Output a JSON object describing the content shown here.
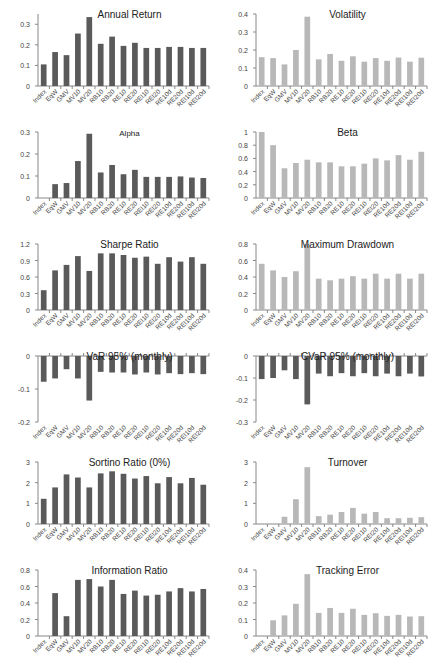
{
  "figure": {
    "categories": [
      "Index",
      "EqW",
      "GMV",
      "MV10",
      "MV20",
      "RB10",
      "RB20",
      "RE10",
      "RE20",
      "REI10",
      "REI20",
      "RE10d",
      "RE20d",
      "REI10d",
      "REI20d"
    ],
    "colors": {
      "dark_bar": "#5a5a5a",
      "light_bar": "#b8b8b8",
      "axis": "#888888"
    }
  },
  "chart_data": [
    {
      "type": "bar",
      "title": "Annual Return",
      "style": "dark",
      "categories": [
        "Index",
        "EqW",
        "GMV",
        "MV10",
        "MV20",
        "RB10",
        "RB20",
        "RE10",
        "RE20",
        "REI10",
        "REI20",
        "RE10d",
        "RE20d",
        "REI10d",
        "REI20d"
      ],
      "values": [
        0.105,
        0.165,
        0.15,
        0.255,
        0.335,
        0.205,
        0.24,
        0.195,
        0.21,
        0.185,
        0.185,
        0.19,
        0.19,
        0.185,
        0.185
      ],
      "ylim": [
        0,
        0.35
      ],
      "yticks": [
        0,
        0.1,
        0.2,
        0.3
      ],
      "ytick_labels": [
        "0",
        "0.1",
        "0.2",
        "0.3"
      ],
      "xlabel": "",
      "ylabel": ""
    },
    {
      "type": "bar",
      "title": "Volatility",
      "style": "light",
      "categories": [
        "Index",
        "EqW",
        "GMV",
        "MV10",
        "MV20",
        "RB10",
        "RB20",
        "RE10",
        "RE20",
        "REI10",
        "REI20",
        "RE10d",
        "RE20d",
        "REI10d",
        "REI20d"
      ],
      "values": [
        0.16,
        0.155,
        0.12,
        0.2,
        0.385,
        0.148,
        0.178,
        0.14,
        0.165,
        0.135,
        0.155,
        0.14,
        0.158,
        0.135,
        0.157
      ],
      "ylim": [
        0,
        0.4
      ],
      "yticks": [
        0,
        0.1,
        0.2,
        0.3,
        0.4
      ],
      "ytick_labels": [
        "0",
        "0.1",
        "0.2",
        "0.3",
        "0.4"
      ],
      "xlabel": "",
      "ylabel": ""
    },
    {
      "type": "bar",
      "title": "Alpha",
      "style": "dark",
      "categories": [
        "Index",
        "EqW",
        "GMV",
        "MV10",
        "MV20",
        "RB10",
        "RB20",
        "RE10",
        "RE20",
        "REI10",
        "REI20",
        "RE10d",
        "RE20d",
        "REI10d",
        "REI20d"
      ],
      "values": [
        0,
        0.063,
        0.068,
        0.168,
        0.292,
        0.116,
        0.15,
        0.108,
        0.128,
        0.096,
        0.096,
        0.096,
        0.098,
        0.093,
        0.091
      ],
      "ylim": [
        0,
        0.3
      ],
      "yticks": [
        0,
        0.1,
        0.2,
        0.3
      ],
      "ytick_labels": [
        "0",
        "0.1",
        "0.2",
        "0.3"
      ],
      "xlabel": "",
      "ylabel": ""
    },
    {
      "type": "bar",
      "title": "Beta",
      "style": "light",
      "categories": [
        "Index",
        "EqW",
        "GMV",
        "MV10",
        "MV20",
        "RB10",
        "RB20",
        "RE10",
        "RE20",
        "REI10",
        "REI20",
        "RE10d",
        "RE20d",
        "REI10d",
        "REI20d"
      ],
      "values": [
        1.0,
        0.8,
        0.45,
        0.53,
        0.58,
        0.54,
        0.54,
        0.48,
        0.48,
        0.52,
        0.6,
        0.57,
        0.65,
        0.58,
        0.7
      ],
      "ylim": [
        0,
        1
      ],
      "yticks": [
        0,
        0.2,
        0.4,
        0.6,
        0.8,
        1
      ],
      "ytick_labels": [
        "0",
        "0.2",
        "0.4",
        "0.6",
        "0.8",
        "1"
      ],
      "xlabel": "",
      "ylabel": ""
    },
    {
      "type": "bar",
      "title": "Sharpe Ratio",
      "style": "dark",
      "categories": [
        "Index",
        "EqW",
        "GMV",
        "MV10",
        "MV20",
        "RB10",
        "RB20",
        "RE10",
        "RE20",
        "REI10",
        "REI20",
        "RE10d",
        "RE20d",
        "REI10d",
        "REI20d"
      ],
      "values": [
        0.36,
        0.72,
        0.82,
        0.98,
        0.71,
        1.03,
        1.03,
        1.0,
        0.95,
        0.97,
        0.84,
        0.96,
        0.88,
        0.96,
        0.84
      ],
      "ylim": [
        0,
        1.2
      ],
      "yticks": [
        0,
        0.3,
        0.6,
        0.9,
        1.2
      ],
      "ytick_labels": [
        "0",
        "0.3",
        "0.6",
        "0.9",
        "1.2"
      ],
      "xlabel": "",
      "ylabel": ""
    },
    {
      "type": "bar",
      "title": "Maximum Drawdown",
      "style": "light",
      "categories": [
        "Index",
        "EqW",
        "GMV",
        "MV10",
        "MV20",
        "RB10",
        "RB20",
        "RE10",
        "RE20",
        "REI10",
        "REI20",
        "RE10d",
        "RE20d",
        "REI10d",
        "REI20d"
      ],
      "values": [
        0.56,
        0.48,
        0.4,
        0.47,
        0.8,
        0.38,
        0.36,
        0.38,
        0.41,
        0.38,
        0.44,
        0.38,
        0.44,
        0.38,
        0.44
      ],
      "ylim": [
        0,
        0.8
      ],
      "yticks": [
        0,
        0.2,
        0.4,
        0.6,
        0.8
      ],
      "ytick_labels": [
        "0",
        "0.2",
        "0.4",
        "0.6",
        "0.8"
      ],
      "xlabel": "",
      "ylabel": ""
    },
    {
      "type": "bar",
      "title": "VaR 95% (monthly)",
      "style": "dark",
      "categories": [
        "Index",
        "EqW",
        "GMV",
        "MV10",
        "MV20",
        "RB10",
        "RB20",
        "RE10",
        "RE20",
        "REI10",
        "REI20",
        "RE10d",
        "RE20d",
        "REI10d",
        "REI20d"
      ],
      "values": [
        -0.078,
        -0.068,
        -0.04,
        -0.068,
        -0.135,
        -0.048,
        -0.05,
        -0.05,
        -0.056,
        -0.05,
        -0.056,
        -0.052,
        -0.055,
        -0.052,
        -0.055
      ],
      "ylim": [
        -0.2,
        0
      ],
      "yticks": [
        -0.2,
        -0.1,
        0
      ],
      "ytick_labels": [
        "-0.2",
        "-0.1",
        "0"
      ],
      "xlabel": "",
      "ylabel": ""
    },
    {
      "type": "bar",
      "title": "CVaR 95% (monthly)",
      "style": "dark",
      "categories": [
        "Index",
        "EqW",
        "GMV",
        "MV10",
        "MV20",
        "RB10",
        "RB20",
        "RE10",
        "RE20",
        "REI10",
        "REI20",
        "RE10d",
        "RE20d",
        "REI10d",
        "REI20d"
      ],
      "values": [
        -0.105,
        -0.1,
        -0.065,
        -0.105,
        -0.22,
        -0.08,
        -0.092,
        -0.078,
        -0.092,
        -0.078,
        -0.092,
        -0.08,
        -0.092,
        -0.08,
        -0.093
      ],
      "ylim": [
        -0.3,
        0
      ],
      "yticks": [
        -0.3,
        -0.2,
        -0.1,
        0
      ],
      "ytick_labels": [
        "-0.3",
        "-0.2",
        "-0.1",
        "0"
      ],
      "xlabel": "",
      "ylabel": ""
    },
    {
      "type": "bar",
      "title": "Sortino Ratio (0%)",
      "style": "dark",
      "categories": [
        "Index",
        "EqW",
        "GMV",
        "MV10",
        "MV20",
        "RB10",
        "RB20",
        "RE10",
        "RE20",
        "REI10",
        "REI20",
        "RE10d",
        "RE20d",
        "REI10d",
        "REI20d"
      ],
      "values": [
        1.22,
        1.77,
        2.4,
        2.25,
        1.77,
        2.45,
        2.55,
        2.43,
        2.2,
        2.32,
        1.97,
        2.27,
        1.97,
        2.23,
        1.9
      ],
      "ylim": [
        0,
        3
      ],
      "yticks": [
        0,
        1,
        2,
        3
      ],
      "ytick_labels": [
        "0",
        "1",
        "2",
        "3"
      ],
      "xlabel": "",
      "ylabel": ""
    },
    {
      "type": "bar",
      "title": "Turnover",
      "style": "light",
      "categories": [
        "Index",
        "EqW",
        "GMV",
        "MV10",
        "MV20",
        "RB10",
        "RB20",
        "RE10",
        "RE20",
        "REI10",
        "REI20",
        "RE10d",
        "RE20d",
        "REI10d",
        "REI20d"
      ],
      "values": [
        0,
        0,
        0.35,
        1.2,
        2.75,
        0.38,
        0.45,
        0.58,
        0.78,
        0.5,
        0.58,
        0.28,
        0.28,
        0.3,
        0.33
      ],
      "ylim": [
        0,
        3
      ],
      "yticks": [
        0,
        1,
        2,
        3
      ],
      "ytick_labels": [
        "0",
        "1",
        "2",
        "3"
      ],
      "xlabel": "",
      "ylabel": ""
    },
    {
      "type": "bar",
      "title": "Information Ratio",
      "style": "dark",
      "categories": [
        "Index",
        "EqW",
        "GMV",
        "MV10",
        "MV20",
        "RB10",
        "RB20",
        "RE10",
        "RE20",
        "REI10",
        "REI20",
        "RE10d",
        "RE20d",
        "REI10d",
        "REI20d"
      ],
      "values": [
        0,
        0.52,
        0.24,
        0.68,
        0.69,
        0.6,
        0.68,
        0.51,
        0.55,
        0.49,
        0.5,
        0.54,
        0.58,
        0.54,
        0.57
      ],
      "ylim": [
        0,
        0.8
      ],
      "yticks": [
        0,
        0.2,
        0.4,
        0.6,
        0.8
      ],
      "ytick_labels": [
        "0",
        "0.2",
        "0.4",
        "0.6",
        "0.8"
      ],
      "xlabel": "",
      "ylabel": ""
    },
    {
      "type": "bar",
      "title": "Tracking Error",
      "style": "light",
      "categories": [
        "Index",
        "EqW",
        "GMV",
        "MV10",
        "MV20",
        "RB10",
        "RB20",
        "RE10",
        "RE20",
        "REI10",
        "REI20",
        "RE10d",
        "RE20d",
        "REI10d",
        "REI20d"
      ],
      "values": [
        0,
        0.095,
        0.125,
        0.195,
        0.375,
        0.14,
        0.17,
        0.14,
        0.165,
        0.128,
        0.138,
        0.122,
        0.128,
        0.118,
        0.12
      ],
      "ylim": [
        0,
        0.4
      ],
      "yticks": [
        0,
        0.1,
        0.2,
        0.3,
        0.4
      ],
      "ytick_labels": [
        "0",
        "0.1",
        "0.2",
        "0.3",
        "0.4"
      ],
      "xlabel": "",
      "ylabel": ""
    }
  ]
}
